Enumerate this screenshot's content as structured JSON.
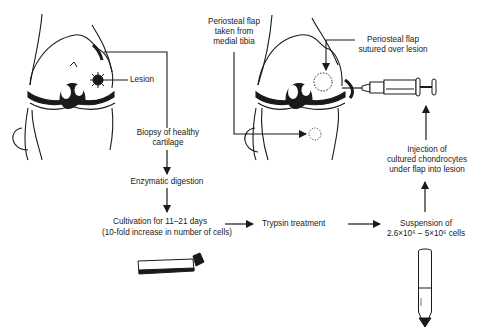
{
  "diagram": {
    "type": "procedure-flowchart",
    "colors": {
      "ink": "#1a1a1a",
      "background": "#ffffff"
    },
    "labels": {
      "lesion": "Lesion",
      "biopsy_line1": "Biopsy of healthy",
      "biopsy_line2": "cartilage",
      "enzymatic": "Enzymatic digestion",
      "cultivation_line1": "Cultivation for 11–21 days",
      "cultivation_line2": "(10-fold increase in number of cells)",
      "trypsin": "Trypsin treatment",
      "suspension_line1": "Suspension of",
      "suspension_line2": "2.6×10⁶ – 5×10⁶ cells",
      "injection_line1": "Injection of",
      "injection_line2": "cultured chondrocytes",
      "injection_line3": "under flap into lesion",
      "flap_taken_line1": "Periosteal flap",
      "flap_taken_line2": "taken from",
      "flap_taken_line3": "medial tibia",
      "flap_sutured_line1": "Periosteal flap",
      "flap_sutured_line2": "sutured over lesion"
    },
    "nodes": [
      {
        "id": "knee-left",
        "kind": "illustration",
        "depicts": "knee joint with cartilage lesion"
      },
      {
        "id": "biopsy",
        "kind": "step"
      },
      {
        "id": "enzymatic",
        "kind": "step"
      },
      {
        "id": "cultivation",
        "kind": "step"
      },
      {
        "id": "culture-flask",
        "kind": "illustration"
      },
      {
        "id": "trypsin",
        "kind": "step"
      },
      {
        "id": "suspension",
        "kind": "step"
      },
      {
        "id": "test-tube",
        "kind": "illustration"
      },
      {
        "id": "injection",
        "kind": "step"
      },
      {
        "id": "knee-right",
        "kind": "illustration",
        "depicts": "knee joint with periosteal flap and syringe"
      }
    ],
    "edges": [
      [
        "knee-left",
        "biopsy"
      ],
      [
        "biopsy",
        "enzymatic"
      ],
      [
        "enzymatic",
        "cultivation"
      ],
      [
        "cultivation",
        "trypsin"
      ],
      [
        "trypsin",
        "suspension"
      ],
      [
        "suspension",
        "injection"
      ],
      [
        "injection",
        "knee-right"
      ]
    ]
  }
}
